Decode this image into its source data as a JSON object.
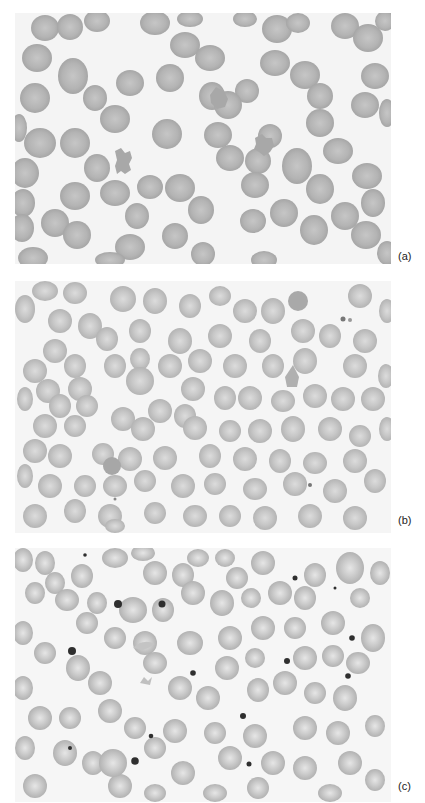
{
  "figure": {
    "panels": [
      {
        "id": "a",
        "label": "(a)",
        "content": "blood smear micrograph — densely stained red cells with some crenated/fragmented cells",
        "colors": {
          "background": "#f4f4f4",
          "cell": "#b3b3b3",
          "cell_center": "#c4c4c4",
          "cell_edge": "#a3a3a3"
        }
      },
      {
        "id": "b",
        "label": "(b)",
        "content": "blood smear micrograph — numerous red cells with central pallor, some target/stomatocyte shapes",
        "colors": {
          "background": "#f5f5f5",
          "cell": "#c4c4c4",
          "cell_center": "#d9d9d9",
          "cell_edge": "#b2b2b2"
        }
      },
      {
        "id": "c",
        "label": "(c)",
        "content": "blood smear micrograph — red cells with scattered dark inclusions (Howell-Jolly bodies) and irregular forms",
        "colors": {
          "background": "#f6f6f6",
          "cell": "#c9c9c9",
          "cell_center": "#e2e2e2",
          "cell_edge": "#aeaeae",
          "inclusion": "#333333"
        }
      }
    ]
  }
}
